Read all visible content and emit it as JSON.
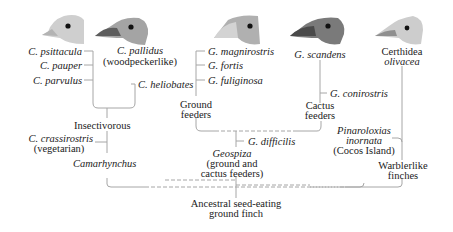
{
  "diagram": {
    "line_color": "#a6a6a6",
    "birds": [
      {
        "id": "c-psittacula-head",
        "species": "C. psittacula",
        "tone": "#c9c9c9"
      },
      {
        "id": "c-pallidus-head",
        "species": "C. pallidus",
        "tone": "#8e8e8e"
      },
      {
        "id": "g-magnirostris-head",
        "species": "G. magnirostris",
        "tone": "#a9a9a9"
      },
      {
        "id": "g-scandens-head",
        "species": "G. scandens",
        "tone": "#6f6f6f"
      },
      {
        "id": "certhidea-head",
        "species": "Certhidea olivacea",
        "tone": "#c4c4c4"
      }
    ],
    "species": {
      "c_psittacula": "C. psittacula",
      "c_pauper": "C. pauper",
      "c_parvulus": "C. parvulus",
      "c_pallidus": "C. pallidus",
      "c_pallidus_note": "(woodpeckerlike)",
      "c_heliobates": "C. heliobates",
      "g_magnirostris": "G. magnirostris",
      "g_fortis": "G. fortis",
      "g_fuliginosa": "G. fuliginosa",
      "g_scandens": "G. scandens",
      "g_conirostris": "G. conirostris",
      "certhidea_1": "Certhidea",
      "certhidea_2": "olivacea",
      "c_crassirostris": "C. crassirostris",
      "c_crassirostris_note": "(vegetarian)",
      "g_difficilis": "G. difficilis",
      "pinaroloxias_1": "Pinaroloxias",
      "pinaroloxias_2": "inornata",
      "pinaroloxias_note": "(Cocos Island)"
    },
    "groups": {
      "ground_1": "Ground",
      "ground_2": "feeders",
      "cactus_1": "Cactus",
      "cactus_2": "feeders",
      "insectivorous": "Insectivorous",
      "camarhynchus": "Camarhynchus",
      "geospiza": "Geospiza",
      "geospiza_note_1": "(ground and",
      "geospiza_note_2": "cactus feeders)",
      "warblerlike_1": "Warblerlike",
      "warblerlike_2": "finches",
      "ancestor_1": "Ancestral seed-eating",
      "ancestor_2": "ground finch"
    }
  }
}
